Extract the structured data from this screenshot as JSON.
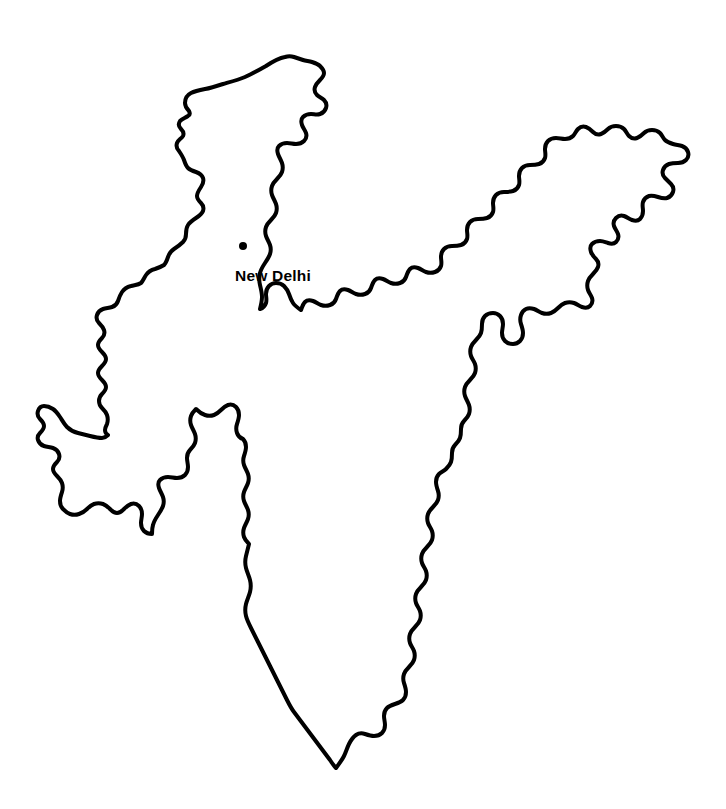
{
  "map": {
    "title": "India",
    "type": "outline-map",
    "background_color": "#ffffff",
    "outline_color": "#000000",
    "outline_width_px": 4,
    "canvas": {
      "width": 726,
      "height": 809
    },
    "markers": [
      {
        "name": "New Delhi",
        "label": "New Delhi",
        "role": "capital",
        "marker_shape": "filled-circle",
        "marker_color": "#000000",
        "x": 243,
        "y": 246,
        "radius_px": 4,
        "label_x": 273,
        "label_y": 281,
        "label_anchor": "middle"
      }
    ],
    "extents": {
      "northernmost": {
        "x": 285,
        "y": 57
      },
      "southernmost": {
        "x": 245,
        "y": 765
      },
      "westernmost": {
        "x": 40,
        "y": 355
      },
      "easternmost": {
        "x": 690,
        "y": 215
      }
    }
  }
}
